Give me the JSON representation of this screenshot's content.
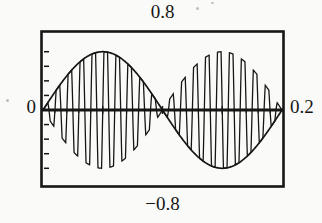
{
  "figure": {
    "colors": {
      "ink": "#161616",
      "paper": "#fafaf8"
    }
  },
  "chart_data": {
    "type": "line",
    "title": "",
    "xlabel": "",
    "ylabel": "",
    "x_range": [
      0,
      0.2
    ],
    "y_window": [
      -0.8,
      0.8
    ],
    "frame_y_range": [
      -1.05,
      1.05
    ],
    "grid": false,
    "legend": "none",
    "labels": {
      "top": "0.8",
      "bottom": "−0.8",
      "left": "0",
      "right": "0.2"
    },
    "series": [
      {
        "name": "envelope",
        "shape": "sine",
        "amplitude": 0.8,
        "frequency_hz": 5,
        "periods_shown": 1,
        "key_points": [
          [
            0,
            0
          ],
          [
            0.05,
            0.8
          ],
          [
            0.1,
            0
          ],
          [
            0.15,
            -0.8
          ],
          [
            0.2,
            0
          ]
        ]
      },
      {
        "name": "modulated-carrier",
        "shape": "product of 5 Hz sine envelope and 100 Hz carrier",
        "amplitude": 0.8,
        "envelope_frequency_hz": 5,
        "carrier_frequency_hz": 100,
        "carrier_cycles_shown": 20
      }
    ],
    "axis": {
      "x_axis_at_y": 0,
      "left_ticks": [
        -0.8,
        -0.6,
        -0.4,
        -0.2,
        0.2,
        0.4,
        0.6,
        0.8
      ],
      "x_major_ticks": [
        0.05,
        0.1,
        0.15
      ],
      "x_minor_step": 0.01
    }
  }
}
